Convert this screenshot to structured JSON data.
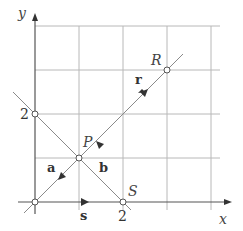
{
  "diagram": {
    "axes": {
      "x_label": "x",
      "y_label": "y"
    },
    "ticks": {
      "x_tick": "2",
      "y_tick": "2"
    },
    "points": {
      "P": {
        "label": "P",
        "coords": [
          1,
          1
        ]
      },
      "R": {
        "label": "R",
        "coords": [
          3,
          3
        ]
      },
      "S": {
        "label": "S",
        "coords": [
          2,
          0
        ]
      },
      "Y2": {
        "label": "",
        "coords": [
          0,
          2
        ]
      },
      "O": {
        "label": "",
        "coords": [
          0,
          0
        ]
      }
    },
    "vectors": {
      "a": "a",
      "b": "b",
      "r": "r",
      "s": "s"
    },
    "grid": {
      "cols": 4,
      "rows": 4,
      "unit_per_cell": 1
    }
  }
}
